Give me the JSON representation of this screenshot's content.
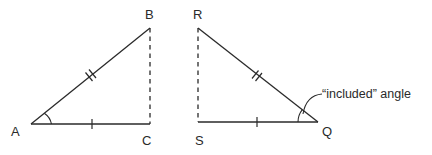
{
  "diagram": {
    "title": "",
    "triangles": [
      {
        "id": "ABC",
        "vertices": {
          "A": {
            "label": "A"
          },
          "B": {
            "label": "B"
          },
          "C": {
            "label": "C"
          }
        },
        "sides": [
          {
            "name": "AB",
            "style": "solid",
            "tick_marks": 2
          },
          {
            "name": "AC",
            "style": "solid",
            "tick_marks": 1
          },
          {
            "name": "BC",
            "style": "dashed",
            "tick_marks": 0
          }
        ],
        "marked_angle": "A"
      },
      {
        "id": "RSQ",
        "vertices": {
          "R": {
            "label": "R"
          },
          "S": {
            "label": "S"
          },
          "Q": {
            "label": "Q"
          }
        },
        "sides": [
          {
            "name": "RQ",
            "style": "solid",
            "tick_marks": 2
          },
          {
            "name": "SQ",
            "style": "solid",
            "tick_marks": 1
          },
          {
            "name": "RS",
            "style": "dashed",
            "tick_marks": 0
          }
        ],
        "marked_angle": "Q"
      }
    ],
    "annotation": {
      "text": "“included” angle",
      "points_to": "angle Q"
    },
    "colors": {
      "stroke": "#2a2a2a",
      "background": "#ffffff"
    }
  }
}
